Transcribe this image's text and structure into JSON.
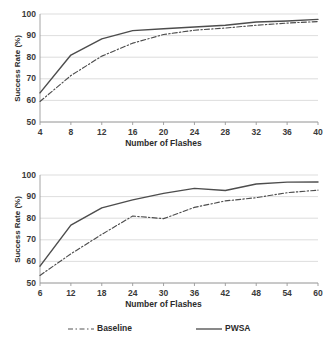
{
  "figure": {
    "background": "#ffffff",
    "line_color": "#4d4d4d",
    "grid_color": "#d4d4d4",
    "axis_color": "#9a9a9a"
  },
  "legend": {
    "position": "bottom",
    "items": [
      {
        "label": "Baseline",
        "style": "dash-dot",
        "color": "#555555"
      },
      {
        "label": "PWSA",
        "style": "solid",
        "color": "#4a4a4a"
      }
    ]
  },
  "chart_data": [
    {
      "type": "line",
      "panel": "top",
      "title": "",
      "xlabel": "Number of Flashes",
      "ylabel": "Success Rate (%)",
      "xlim": [
        4,
        40
      ],
      "ylim": [
        50,
        100
      ],
      "xticks": [
        4,
        8,
        12,
        16,
        20,
        24,
        28,
        32,
        36,
        40
      ],
      "yticks": [
        50,
        60,
        70,
        80,
        90,
        100
      ],
      "grid": true,
      "x": [
        4,
        8,
        12,
        16,
        20,
        24,
        28,
        32,
        36,
        40
      ],
      "series": [
        {
          "name": "Baseline",
          "style": "dash-dot",
          "values": [
            59.5,
            71.5,
            80.5,
            86.5,
            90.5,
            92.5,
            93.5,
            94.8,
            95.8,
            96.5
          ]
        },
        {
          "name": "PWSA",
          "style": "solid",
          "values": [
            63.5,
            81.0,
            88.5,
            92.3,
            93.2,
            94.0,
            94.8,
            96.3,
            96.8,
            97.5
          ]
        }
      ]
    },
    {
      "type": "line",
      "panel": "bottom",
      "title": "",
      "xlabel": "Number of Flashes",
      "ylabel": "Success Rate (%)",
      "xlim": [
        6,
        60
      ],
      "ylim": [
        50,
        100
      ],
      "xticks": [
        6,
        12,
        18,
        24,
        30,
        36,
        42,
        48,
        54,
        60
      ],
      "yticks": [
        50,
        60,
        70,
        80,
        90,
        100
      ],
      "grid": true,
      "x": [
        6,
        12,
        18,
        24,
        30,
        36,
        42,
        48,
        54,
        60
      ],
      "series": [
        {
          "name": "Baseline",
          "style": "dash-dot",
          "values": [
            53.5,
            63.5,
            72.5,
            81.0,
            79.8,
            85.0,
            88.0,
            89.5,
            91.8,
            93.0
          ]
        },
        {
          "name": "PWSA",
          "style": "solid",
          "values": [
            57.8,
            76.8,
            84.8,
            88.5,
            91.5,
            93.8,
            92.8,
            95.8,
            96.7,
            96.8
          ]
        }
      ]
    }
  ]
}
